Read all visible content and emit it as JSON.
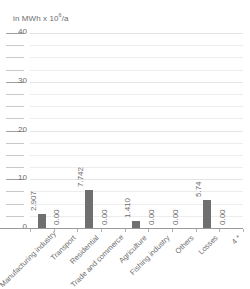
{
  "chart_data": {
    "type": "bar",
    "title": "",
    "subtitle": "",
    "unit_caption": "in MWh x 10",
    "unit_exponent": "6",
    "unit_caption_suffix": "/a",
    "ylabel": "",
    "xlabel": "",
    "ylim": [
      0,
      40
    ],
    "y_ticks_major": [
      0,
      10,
      20,
      30,
      40
    ],
    "y_ticks_major_labels": [
      "0",
      "10",
      "20",
      "30",
      "40"
    ],
    "y_minor_step": 2.5,
    "grid": true,
    "legend": "none",
    "bar_color": "#6f6f6f",
    "gridline_color": "#ededed",
    "axis_color": "#9a9a9a",
    "text_color": "#6d6d6d",
    "categories": [
      "Manufacturing industry",
      "Transport",
      "Residential",
      "Trade and commerce",
      "Agriculture",
      "Fishing industry",
      "Others",
      "Losses",
      "4 *"
    ],
    "values": [
      2.907,
      0.0,
      7.742,
      0.0,
      1.41,
      0.0,
      0.0,
      5.74,
      0.0
    ],
    "value_labels": [
      "2.907",
      "0.00",
      "7.742",
      "0.00",
      "1.410",
      "0.00",
      "0.00",
      "5.74",
      "0.00"
    ]
  }
}
